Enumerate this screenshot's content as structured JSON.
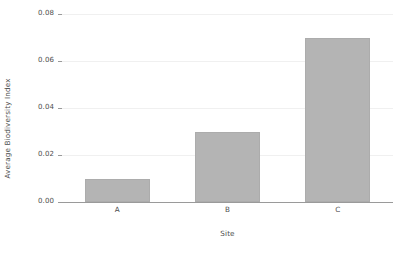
{
  "chart_data": {
    "type": "bar",
    "title": "",
    "subtitle": "",
    "xlabel": "Site",
    "ylabel": "Average Biodiversity Index",
    "categories": [
      "A",
      "B",
      "C"
    ],
    "values": [
      0.01,
      0.03,
      0.07
    ],
    "ylim": [
      0.0,
      0.08
    ],
    "yticks": [
      "0.00",
      "0.02",
      "0.04",
      "0.06",
      "0.08"
    ],
    "ytick_values": [
      0.0,
      0.02,
      0.04,
      0.06,
      0.08
    ],
    "grid": true,
    "legend": false,
    "legend_position": "none",
    "series": [
      {
        "name": "Average Biodiversity Index",
        "values": [
          0.01,
          0.03,
          0.07
        ]
      }
    ],
    "annotations": [],
    "colors": {
      "bar_fill": "#b4b4b4",
      "bar_edge": "#acacac",
      "gridline": "#f0f0f0",
      "axis_line": "#9a9a9a",
      "text": "#4d4d4d",
      "background": "#ffffff"
    }
  }
}
